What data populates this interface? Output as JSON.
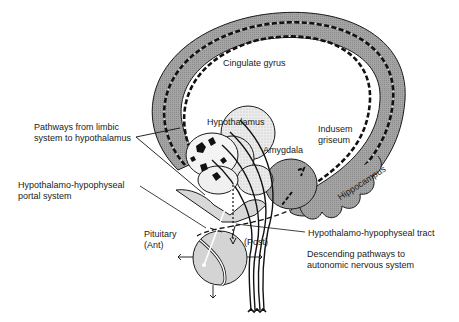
{
  "diagram": {
    "type": "anatomical-schematic",
    "colors": {
      "background": "#ffffff",
      "limbic_fill": "#9a9a9a",
      "hypothalamus_fill": "#e6e6e6",
      "pituitary_fill": "#d4d4d4",
      "outline": "#1a1a1a",
      "pathway_dash": "#111111",
      "pathway_dot": "#ffffff"
    },
    "labels": {
      "cingulate_gyrus": "Cingulate gyrus",
      "hypothalamus": "Hypothalamus",
      "amygdala": "Amygdala",
      "indusem_griseum_line1": "Indusem",
      "indusem_griseum_line2": "griseum",
      "hippocampus": "Hippocampus",
      "pathways_line1": "Pathways from limbic",
      "pathways_line2": "system to hypothalamus",
      "portal_line1": "Hypothalamo-hypophyseal",
      "portal_line2": "portal system",
      "pituitary_line1": "Pituitary",
      "pituitary_line2": "(Ant)",
      "posterior": "(Post)",
      "tract": "Hypothalamo-hypophyseal tract",
      "descending_line1": "Descending pathways to",
      "descending_line2": "autonomic nervous system"
    }
  }
}
